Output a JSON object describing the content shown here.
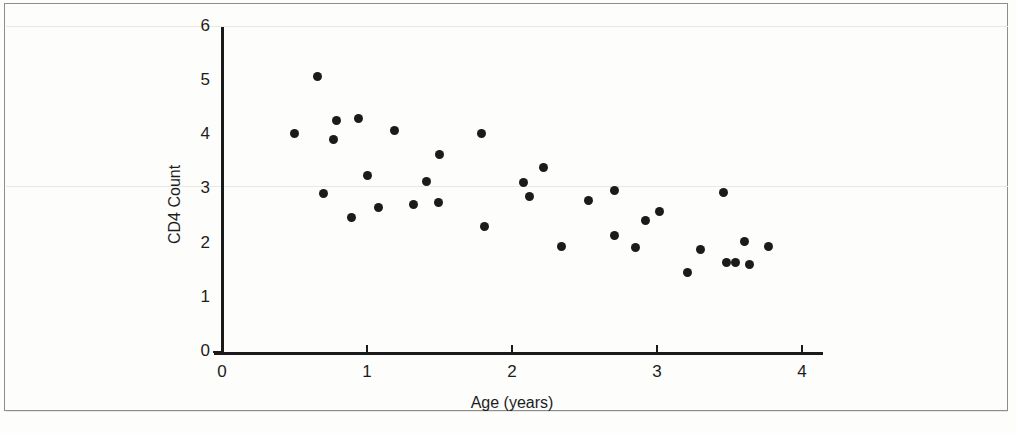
{
  "figure": {
    "background_color": "#fdfdfb",
    "frame_color": "#8d8d8d",
    "marker_color": "#1b1b1b",
    "axis_color": "#1a1a1a"
  },
  "chart_data": {
    "type": "scatter",
    "title": "",
    "xlabel": "Age (years)",
    "ylabel": "CD4 Count",
    "xlim": [
      0,
      4.1
    ],
    "ylim": [
      0,
      6
    ],
    "xticks": [
      0,
      1,
      2,
      3,
      4
    ],
    "xtick_labels": [
      "0",
      "1",
      "2",
      "3",
      "4"
    ],
    "yticks": [
      0,
      1,
      2,
      3,
      4,
      5,
      6
    ],
    "ytick_labels": [
      "0",
      "1",
      "2",
      "3",
      "4",
      "5",
      "6"
    ],
    "grid": false,
    "legend": null,
    "series": [
      {
        "name": "CD4 Count vs Age",
        "marker": "filled-circle",
        "points": [
          {
            "x": 0.5,
            "y": 4.03
          },
          {
            "x": 0.66,
            "y": 5.08
          },
          {
            "x": 0.7,
            "y": 2.93
          },
          {
            "x": 0.77,
            "y": 3.92
          },
          {
            "x": 0.79,
            "y": 4.28
          },
          {
            "x": 0.89,
            "y": 2.48
          },
          {
            "x": 0.94,
            "y": 4.3
          },
          {
            "x": 1.0,
            "y": 3.26
          },
          {
            "x": 1.08,
            "y": 2.66
          },
          {
            "x": 1.19,
            "y": 4.08
          },
          {
            "x": 1.32,
            "y": 2.72
          },
          {
            "x": 1.41,
            "y": 3.14
          },
          {
            "x": 1.49,
            "y": 2.75
          },
          {
            "x": 1.5,
            "y": 3.65
          },
          {
            "x": 1.79,
            "y": 4.03
          },
          {
            "x": 1.81,
            "y": 2.31
          },
          {
            "x": 2.08,
            "y": 3.13
          },
          {
            "x": 2.12,
            "y": 2.86
          },
          {
            "x": 2.22,
            "y": 3.41
          },
          {
            "x": 2.34,
            "y": 1.94
          },
          {
            "x": 2.53,
            "y": 2.79
          },
          {
            "x": 2.71,
            "y": 2.98
          },
          {
            "x": 2.71,
            "y": 2.15
          },
          {
            "x": 2.85,
            "y": 1.93
          },
          {
            "x": 2.92,
            "y": 2.43
          },
          {
            "x": 3.02,
            "y": 2.6
          },
          {
            "x": 3.21,
            "y": 1.46
          },
          {
            "x": 3.3,
            "y": 1.9
          },
          {
            "x": 3.46,
            "y": 2.94
          },
          {
            "x": 3.48,
            "y": 1.66
          },
          {
            "x": 3.54,
            "y": 1.66
          },
          {
            "x": 3.6,
            "y": 2.03
          },
          {
            "x": 3.64,
            "y": 1.62
          },
          {
            "x": 3.77,
            "y": 1.94
          }
        ]
      }
    ]
  }
}
